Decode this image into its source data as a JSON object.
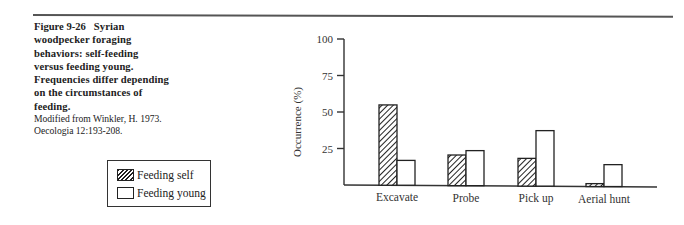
{
  "figure": {
    "number": "Figure 9-26",
    "caption_lines": [
      "Syrian",
      "woodpecker foraging",
      "behaviors: self-feeding",
      "versus feeding young.",
      "Frequencies differ depending",
      "on the circumstances of",
      "feeding."
    ],
    "credit_lines": [
      "Modified from Winkler, H. 1973.",
      "Oecologia 12:193-208."
    ]
  },
  "legend": {
    "items": [
      {
        "label": "Feeding self",
        "pattern": "hatched"
      },
      {
        "label": "Feeding young",
        "pattern": "open"
      }
    ]
  },
  "chart_data": {
    "type": "bar",
    "title": "",
    "xlabel": "",
    "ylabel": "Occurrence (%)",
    "ylim": [
      0,
      100
    ],
    "yticks": [
      25,
      50,
      75,
      100
    ],
    "grid": false,
    "legend_position": "left, below caption",
    "categories": [
      "Excavate",
      "Probe",
      "Pick up",
      "Aerial hunt"
    ],
    "series": [
      {
        "name": "Feeding self",
        "pattern": "hatched",
        "values": [
          55,
          21,
          19,
          2
        ]
      },
      {
        "name": "Feeding young",
        "pattern": "open",
        "values": [
          17,
          24,
          38,
          15
        ]
      }
    ]
  }
}
